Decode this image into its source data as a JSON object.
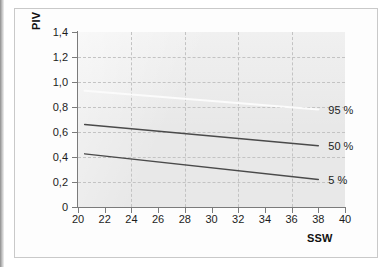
{
  "chart_data": {
    "type": "line",
    "title": "",
    "xlabel": "SSW",
    "ylabel": "PIV",
    "xlim": [
      20,
      40
    ],
    "ylim": [
      0,
      1.4
    ],
    "grid": true,
    "legend_position": "right-inline",
    "xticks": [
      "20",
      "22",
      "24",
      "26",
      "28",
      "30",
      "32",
      "34",
      "36",
      "38",
      "40"
    ],
    "xtick_values": [
      20,
      22,
      24,
      26,
      28,
      30,
      32,
      34,
      36,
      38,
      40
    ],
    "yticks": [
      "0",
      "0,2",
      "0,4",
      "0,6",
      "0,8",
      "1,0",
      "1,2",
      "1,4"
    ],
    "ytick_values": [
      0,
      0.2,
      0.4,
      0.6,
      0.8,
      1.0,
      1.2,
      1.4
    ],
    "x_gridlines": [
      24,
      28,
      32,
      36
    ],
    "y_gridlines": [
      0.2,
      0.4,
      0.6,
      0.8,
      1.0,
      1.2
    ],
    "series": [
      {
        "name": "95 %",
        "label": "95 %",
        "color": "#fbfbfb",
        "x": [
          20.5,
          38.0
        ],
        "values": [
          0.93,
          0.78
        ]
      },
      {
        "name": "50 %",
        "label": "50 %",
        "color": "#4a4a4a",
        "x": [
          20.5,
          38.0
        ],
        "values": [
          0.66,
          0.49
        ]
      },
      {
        "name": "5 %",
        "label": "5 %",
        "color": "#4a4a4a",
        "x": [
          20.5,
          38.0
        ],
        "values": [
          0.425,
          0.22
        ]
      }
    ]
  },
  "figure": {
    "axis_title_y": "PIV",
    "axis_title_x": "SSW",
    "plot_background": "#e8e8e8",
    "page_background": "#ffffff",
    "grid_color": "#c3c3c3",
    "axis_color": "#7b7b7b"
  }
}
